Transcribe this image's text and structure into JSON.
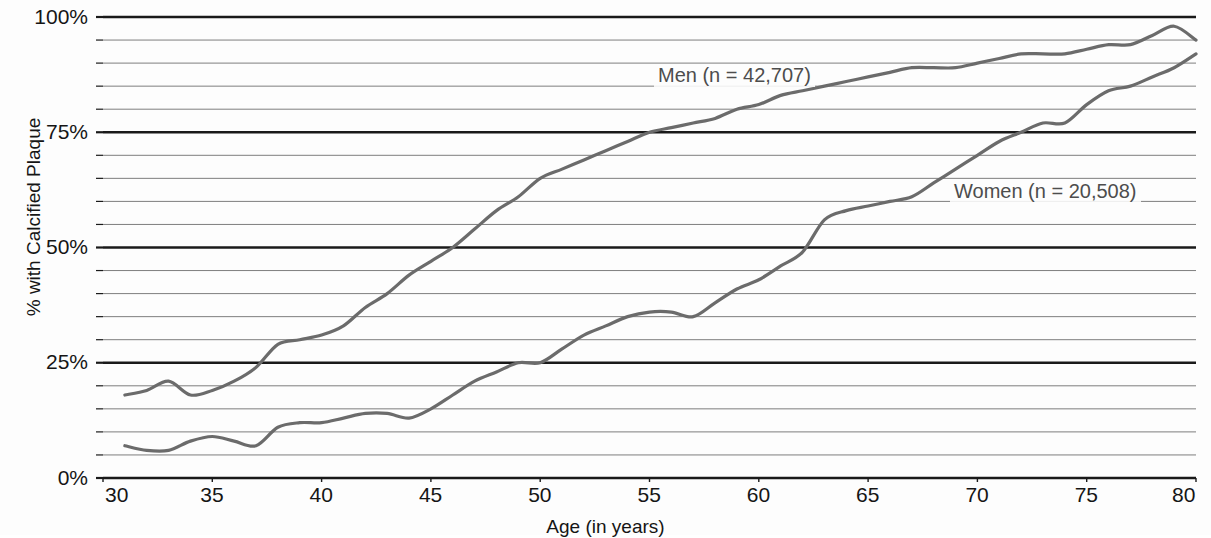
{
  "chart_data": {
    "type": "line",
    "title": "",
    "xlabel": "Age (in years)",
    "ylabel": "% with Calcified Plaque",
    "xlim": [
      30,
      80
    ],
    "ylim": [
      0,
      100
    ],
    "xticks": [
      "30",
      "35",
      "40",
      "45",
      "50",
      "55",
      "60",
      "65",
      "70",
      "75",
      "80"
    ],
    "yticks": [
      "0%",
      "25%",
      "50%",
      "75%",
      "100%"
    ],
    "grid": "horizontal gridlines every 5%, major dark lines at 0, 25, 50, 75, 100",
    "legend_position": "inline-annotation",
    "line_color": "#6b6b6b",
    "major_gridline_color": "#1a1a1a",
    "minor_gridline_color": "#7e7e7e",
    "series": [
      {
        "name": "Men (n = 42,707)",
        "x": [
          31,
          32,
          33,
          34,
          35,
          36,
          37,
          38,
          39,
          40,
          41,
          42,
          43,
          44,
          45,
          46,
          47,
          48,
          49,
          50,
          51,
          52,
          53,
          54,
          55,
          56,
          57,
          58,
          59,
          60,
          61,
          62,
          63,
          64,
          65,
          66,
          67,
          68,
          69,
          70,
          71,
          72,
          73,
          74,
          75,
          76,
          77,
          78,
          79,
          80
        ],
        "values": [
          18,
          19,
          21,
          18,
          19,
          21,
          24,
          29,
          30,
          31,
          33,
          37,
          40,
          44,
          47,
          50,
          54,
          58,
          61,
          65,
          67,
          69,
          71,
          73,
          75,
          76,
          77,
          78,
          80,
          81,
          83,
          84,
          85,
          86,
          87,
          88,
          89,
          89,
          89,
          90,
          91,
          92,
          92,
          92,
          93,
          94,
          94,
          96,
          98,
          95
        ]
      },
      {
        "name": "Women (n = 20,508)",
        "x": [
          31,
          32,
          33,
          34,
          35,
          36,
          37,
          38,
          39,
          40,
          41,
          42,
          43,
          44,
          45,
          46,
          47,
          48,
          49,
          50,
          51,
          52,
          53,
          54,
          55,
          56,
          57,
          58,
          59,
          60,
          61,
          62,
          63,
          64,
          65,
          66,
          67,
          68,
          69,
          70,
          71,
          72,
          73,
          74,
          75,
          76,
          77,
          78,
          79,
          80
        ],
        "values": [
          7,
          6,
          6,
          8,
          9,
          8,
          7,
          11,
          12,
          12,
          13,
          14,
          14,
          13,
          15,
          18,
          21,
          23,
          25,
          25,
          28,
          31,
          33,
          35,
          36,
          36,
          35,
          38,
          41,
          43,
          46,
          49,
          56,
          58,
          59,
          60,
          61,
          64,
          67,
          70,
          73,
          75,
          77,
          77,
          81,
          84,
          85,
          87,
          89,
          92
        ]
      }
    ]
  },
  "axis": {
    "y_title": "% with Calcified Plaque",
    "x_title": "Age (in years)"
  }
}
